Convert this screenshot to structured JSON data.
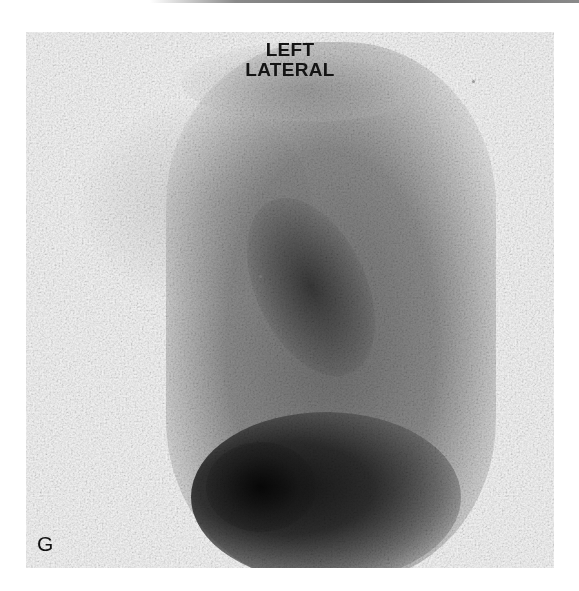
{
  "figure": {
    "view_label_line1": "LEFT",
    "view_label_line2": "LATERAL",
    "panel_letter": "G",
    "image_type": "grayscale scintigraphy scan",
    "colors": {
      "background": "#ffffff",
      "panel_background": "#f4f4f4",
      "label_text": "#141414",
      "dark_uptake": "#1a1a1a"
    }
  }
}
